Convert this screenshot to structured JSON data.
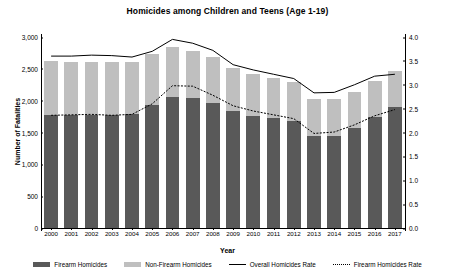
{
  "chart_data": {
    "type": "bar",
    "title": "Homicides among Children and Teens (Age 1-19)",
    "xlabel": "Year",
    "ylabel": "Number of Fatalities",
    "ylabel_right": "Fatality Rate (per 100,000)",
    "categories": [
      "2000",
      "2001",
      "2002",
      "2003",
      "2004",
      "2005",
      "2006",
      "2007",
      "2008",
      "2009",
      "2010",
      "2011",
      "2012",
      "2013",
      "2014",
      "2015",
      "2016",
      "2017"
    ],
    "ylim": [
      0,
      3000
    ],
    "yticks": [
      "0",
      "500",
      "1,000",
      "1,500",
      "2,000",
      "2,500",
      "3,000"
    ],
    "ytick_values": [
      0,
      500,
      1000,
      1500,
      2000,
      2500,
      3000
    ],
    "ylim_right": [
      0.0,
      4.0
    ],
    "yticks_right": [
      "0.0",
      "0.5",
      "1.0",
      "1.5",
      "2.0",
      "2.5",
      "3.0",
      "3.5",
      "4.0"
    ],
    "ytick_values_right": [
      0.0,
      0.5,
      1.0,
      1.5,
      2.0,
      2.5,
      3.0,
      3.5,
      4.0
    ],
    "grid": false,
    "legend_position": "bottom",
    "series": [
      {
        "name": "Firearm Homicides",
        "kind": "bar-stack",
        "color": "#595959",
        "axis": "left",
        "values": [
          1775,
          1780,
          1780,
          1775,
          1785,
          1940,
          2050,
          2040,
          1970,
          1840,
          1765,
          1730,
          1680,
          1440,
          1450,
          1575,
          1745,
          1900
        ]
      },
      {
        "name": "Non-Firearm Homicides",
        "kind": "bar-stack",
        "color": "#bfbfbf",
        "axis": "left",
        "values": [
          845,
          830,
          835,
          830,
          820,
          790,
          790,
          745,
          710,
          680,
          660,
          630,
          610,
          585,
          575,
          560,
          560,
          565
        ]
      },
      {
        "name": "Overall Homicides  Rate",
        "kind": "line",
        "style": "solid",
        "color": "#000000",
        "axis": "right",
        "values": [
          3.6,
          3.6,
          3.62,
          3.61,
          3.58,
          3.7,
          3.95,
          3.87,
          3.72,
          3.42,
          3.31,
          3.22,
          3.13,
          2.83,
          2.84,
          3.0,
          3.18,
          3.22
        ]
      },
      {
        "name": "Firearm Homicides Rate",
        "kind": "line",
        "style": "dotted",
        "color": "#000000",
        "axis": "right",
        "values": [
          2.36,
          2.37,
          2.38,
          2.36,
          2.38,
          2.6,
          2.98,
          2.97,
          2.78,
          2.56,
          2.45,
          2.37,
          2.29,
          1.98,
          2.01,
          2.16,
          2.35,
          2.48
        ]
      }
    ]
  },
  "legend": {
    "items": [
      {
        "label": "Firearm Homicides",
        "marker": "box-dark"
      },
      {
        "label": "Non-Firearm Homicides",
        "marker": "box-light"
      },
      {
        "label": "Overall Homicides  Rate",
        "marker": "line-solid"
      },
      {
        "label": "Firearm Homicides Rate",
        "marker": "line-dotted"
      }
    ]
  }
}
